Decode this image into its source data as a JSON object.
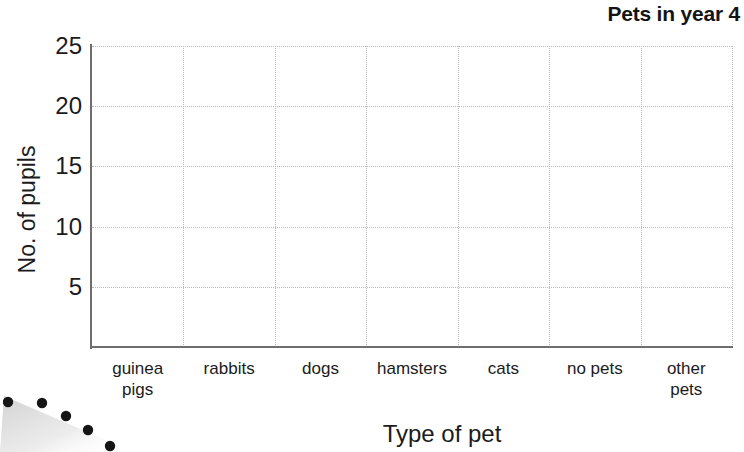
{
  "chart_data": {
    "type": "bar",
    "title": "Pets in year 4",
    "xlabel": "Type of pet",
    "ylabel": "No. of pupils",
    "categories": [
      "guinea pigs",
      "rabbits",
      "dogs",
      "hamsters",
      "cats",
      "no pets",
      "other pets"
    ],
    "category_lines": [
      [
        "guinea",
        "pigs"
      ],
      [
        "rabbits"
      ],
      [
        "dogs"
      ],
      [
        "hamsters"
      ],
      [
        "cats"
      ],
      [
        "no pets"
      ],
      [
        "other",
        "pets"
      ]
    ],
    "values": [
      null,
      null,
      null,
      null,
      null,
      null,
      null
    ],
    "series": [
      {
        "name": "No. of pupils",
        "values": [
          null,
          null,
          null,
          null,
          null,
          null,
          null
        ]
      }
    ],
    "ylim": [
      0,
      25
    ],
    "ytick_values": [
      25,
      20,
      15,
      10,
      5
    ],
    "ytick_labels": [
      "25",
      "20",
      "15",
      "10",
      "5"
    ],
    "ytick_interval": 5,
    "grid": true,
    "grid_style": "dotted",
    "legend": "none",
    "note": "Blank graph template - axes and gridlines drawn, no bars plotted",
    "colors": {
      "text": "#1b1b1b",
      "gridline": "#b9b9b9",
      "axis": "#6e6e6e",
      "background": "#ffffff"
    }
  },
  "artifact": {
    "name": "scan-edge-smudge",
    "description": "diagonal row of dark dots with grey shadow at bottom-left page edge",
    "dot_count": 5
  }
}
